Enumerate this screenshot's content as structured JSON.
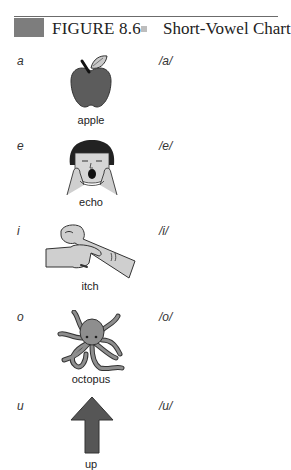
{
  "header": {
    "figure_label": "FIGURE 8.6",
    "separator": "■",
    "title": "Short-Vowel Chart"
  },
  "rows": [
    {
      "letter": "a",
      "word": "apple",
      "sound": "/a/",
      "icon": "apple-icon"
    },
    {
      "letter": "e",
      "word": "echo",
      "sound": "/e/",
      "icon": "shouting-face-icon"
    },
    {
      "letter": "i",
      "word": "itch",
      "sound": "/i/",
      "icon": "scratching-arm-icon"
    },
    {
      "letter": "o",
      "word": "octopus",
      "sound": "/o/",
      "icon": "octopus-icon"
    },
    {
      "letter": "u",
      "word": "up",
      "sound": "/u/",
      "icon": "up-arrow-icon"
    }
  ],
  "colors": {
    "header_block": "#7d7d7d",
    "rule": "#6b6b6b",
    "illustration_dark": "#5a5a5a",
    "illustration_light": "#c8c8c8"
  }
}
